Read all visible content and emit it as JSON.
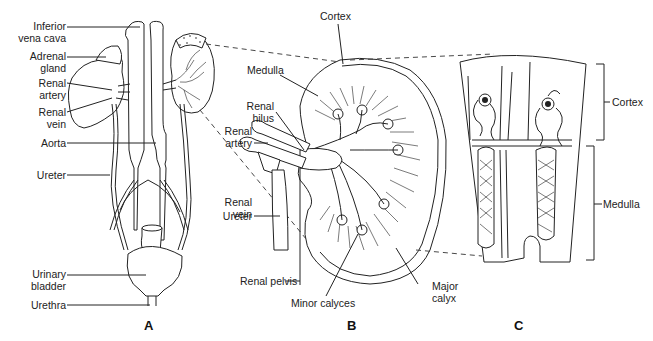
{
  "figure": {
    "panels": [
      {
        "id": "A",
        "label": "A",
        "labels": {
          "inferior_vena_cava": "Inferior\nvena cava",
          "adrenal_gland": "Adrenal\ngland",
          "renal_artery": "Renal\nartery",
          "renal_vein": "Renal\nvein",
          "aorta": "Aorta",
          "ureter": "Ureter",
          "urinary_bladder": "Urinary\nbladder",
          "urethra": "Urethra"
        }
      },
      {
        "id": "B",
        "label": "B",
        "labels": {
          "cortex": "Cortex",
          "medulla": "Medulla",
          "renal_hilus": "Renal\nhilus",
          "renal_artery": "Renal\nartery",
          "renal_vein": "Renal\nvein",
          "ureter": "Ureter",
          "renal_pelvis": "Renal pelvis",
          "minor_calyces": "Minor calyces",
          "major_calyx": "Major\ncalyx"
        }
      },
      {
        "id": "C",
        "label": "C",
        "labels": {
          "cortex": "Cortex",
          "medulla": "Medulla"
        }
      }
    ],
    "colors": {
      "line": "#222222",
      "background": "#ffffff"
    }
  }
}
